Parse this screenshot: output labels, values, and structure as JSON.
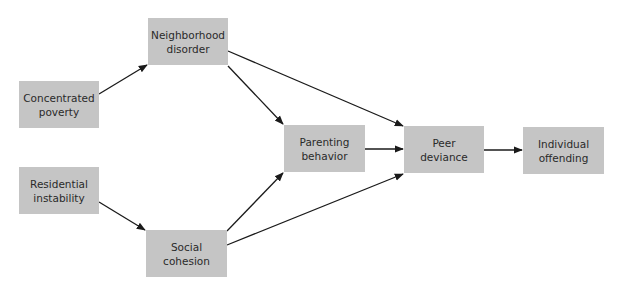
{
  "diagram": {
    "nodes": {
      "neighborhood_disorder": {
        "line1": "Neighborhood",
        "line2": "disorder"
      },
      "concentrated_poverty": {
        "line1": "Concentrated",
        "line2": "poverty"
      },
      "residential_instability": {
        "line1": "Residential",
        "line2": "instability"
      },
      "social_cohesion": {
        "line1": "Social",
        "line2": "cohesion"
      },
      "parenting_behavior": {
        "line1": "Parenting",
        "line2": "behavior"
      },
      "peer_deviance": {
        "line1": "Peer",
        "line2": "deviance"
      },
      "individual_offending": {
        "line1": "Individual",
        "line2": "offending"
      }
    },
    "edges": [
      {
        "from": "Concentrated poverty",
        "to": "Neighborhood disorder"
      },
      {
        "from": "Residential instability",
        "to": "Social cohesion"
      },
      {
        "from": "Neighborhood disorder",
        "to": "Parenting behavior"
      },
      {
        "from": "Neighborhood disorder",
        "to": "Peer deviance"
      },
      {
        "from": "Social cohesion",
        "to": "Parenting behavior"
      },
      {
        "from": "Social cohesion",
        "to": "Peer deviance"
      },
      {
        "from": "Parenting behavior",
        "to": "Peer deviance"
      },
      {
        "from": "Peer deviance",
        "to": "Individual offending"
      }
    ],
    "colors": {
      "box": "#c5c5c5",
      "arrow": "#1a1a1a",
      "text": "#2a2a2a"
    }
  }
}
